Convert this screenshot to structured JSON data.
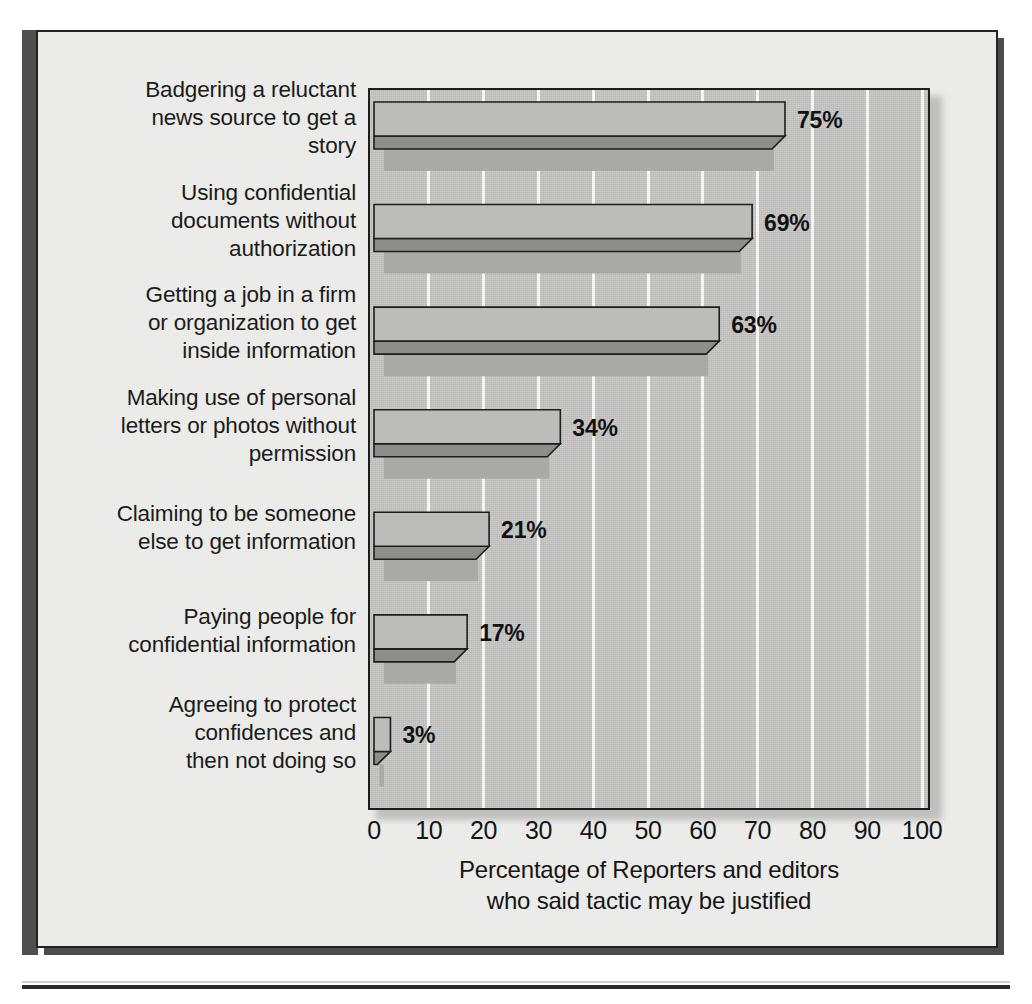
{
  "chart_data": {
    "type": "bar",
    "orientation": "horizontal",
    "title": "",
    "xlabel": "Percentage of Reporters and editors who said tactic may be justified",
    "xlabel_line1": "Percentage of Reporters and editors",
    "xlabel_line2": "who said tactic may be justified",
    "ylabel": "",
    "xlim": [
      0,
      100
    ],
    "xticks": [
      "0",
      "10",
      "20",
      "30",
      "40",
      "50",
      "60",
      "70",
      "80",
      "90",
      "100"
    ],
    "grid": "vertical-white-gridlines",
    "legend": "none",
    "categories": [
      "Badgering a reluctant news source to get a story",
      "Using confidential documents without authorization",
      "Getting a job in a firm or organization to get inside information",
      "Making use of personal letters or photos without permission",
      "Claiming to be someone else to get information",
      "Paying people for confidential information",
      "Agreeing to protect confidences and then not doing so"
    ],
    "category_lines": [
      [
        "Badgering a reluctant",
        "news source to get a",
        "story"
      ],
      [
        "Using confidential",
        "documents without",
        "authorization"
      ],
      [
        "Getting a job in a firm",
        "or organization to get",
        "inside information"
      ],
      [
        "Making use of personal",
        "letters or photos without",
        "permission"
      ],
      [
        "Claiming to be someone",
        "else to get information"
      ],
      [
        "Paying people for",
        "confidential information"
      ],
      [
        "Agreeing to protect",
        "confidences and",
        "then not doing so"
      ]
    ],
    "values": [
      75,
      69,
      63,
      34,
      21,
      17,
      3
    ],
    "value_labels": [
      "75%",
      "69%",
      "63%",
      "34%",
      "21%",
      "17%",
      "3%"
    ],
    "colors": {
      "bar_top_face": "#bcbcba",
      "bar_front_face": "#8d8d8b",
      "bar_shadow": "#a9a9a7",
      "bar_outline": "#1d1d1d",
      "plot_background": "#c6c6c4",
      "gridline": "#f4f4f2",
      "page_background": "#eeeeec",
      "frame_border": "#232323",
      "text": "#151515"
    }
  }
}
